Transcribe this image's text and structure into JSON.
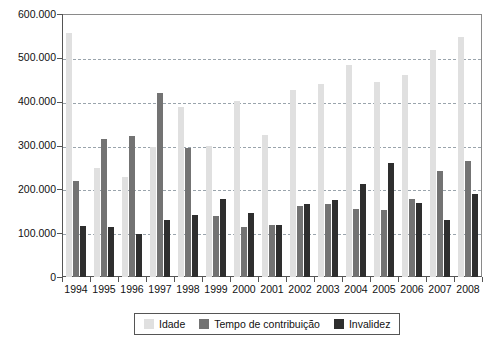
{
  "chart_data": {
    "type": "bar",
    "title": "",
    "xlabel": "",
    "ylabel": "",
    "grid": true,
    "legend_position": "bottom",
    "ylim": [
      0,
      600000
    ],
    "yticks": [
      0,
      100000,
      200000,
      300000,
      400000,
      500000,
      600000
    ],
    "ytick_labels": [
      "0",
      "100.000",
      "200.000",
      "300.000",
      "400.000",
      "500.000",
      "600.000"
    ],
    "categories": [
      "1994",
      "1995",
      "1996",
      "1997",
      "1998",
      "1999",
      "2000",
      "2001",
      "2002",
      "2003",
      "2004",
      "2005",
      "2006",
      "2007",
      "2008"
    ],
    "series": [
      {
        "name": "Idade",
        "color": "#e0e0e0",
        "values": [
          557000,
          249000,
          228000,
          297000,
          389000,
          298000,
          401000,
          324000,
          427000,
          440000,
          483000,
          444000,
          461000,
          518000,
          548000
        ]
      },
      {
        "name": "Tempo de contribuição",
        "color": "#737373",
        "values": [
          220000,
          316000,
          321000,
          419000,
          294000,
          140000,
          113000,
          119000,
          161000,
          167000,
          156000,
          152000,
          178000,
          243000,
          265000
        ]
      },
      {
        "name": "Invalidez",
        "color": "#2e2e2e",
        "values": [
          117000,
          113000,
          99000,
          130000,
          141000,
          179000,
          146000,
          119000,
          166000,
          175000,
          212000,
          261000,
          168000,
          131000,
          190000
        ]
      }
    ]
  },
  "legend": {
    "items": [
      {
        "label": "Idade",
        "color": "#e0e0e0"
      },
      {
        "label": "Tempo de contribuição",
        "color": "#737373"
      },
      {
        "label": "Invalidez",
        "color": "#2e2e2e"
      }
    ]
  }
}
